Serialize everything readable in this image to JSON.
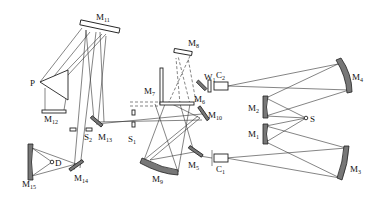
{
  "diagram": {
    "type": "optical-schematic",
    "labels": {
      "M1": "M",
      "M1_sub": "1",
      "M2": "M",
      "M2_sub": "2",
      "M3": "M",
      "M3_sub": "3",
      "M4": "M",
      "M4_sub": "4",
      "M5": "M",
      "M5_sub": "5",
      "M6": "M",
      "M6_sub": "6",
      "M7": "M",
      "M7_sub": "7",
      "M8": "M",
      "M8_sub": "8",
      "M9": "M",
      "M9_sub": "9",
      "M10": "M",
      "M10_sub": "10",
      "M11": "M",
      "M11_sub": "11",
      "M12": "M",
      "M12_sub": "12",
      "M13": "M",
      "M13_sub": "13",
      "M14": "M",
      "M14_sub": "14",
      "M15": "M",
      "M15_sub": "15",
      "S": "S",
      "S1": "S",
      "S1_sub": "1",
      "S2": "S",
      "S2_sub": "2",
      "P": "P",
      "D": "D",
      "W1": "W",
      "W1_sub": "1",
      "C1": "C",
      "C1_sub": "1",
      "C2": "C",
      "C2_sub": "2"
    },
    "components": [
      "source S",
      "mirrors M1–M15",
      "prism P",
      "slits S1, S2",
      "cells C1, C2",
      "window W1",
      "detector D"
    ]
  }
}
